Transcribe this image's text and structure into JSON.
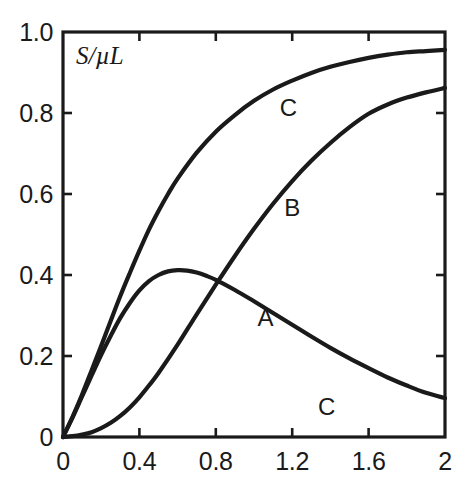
{
  "chart_data": {
    "type": "line",
    "title": "",
    "subtitle": "",
    "xlabel": "",
    "ylabel": "S/µL",
    "ylabel_display": "S/µL",
    "xlim": [
      0,
      2
    ],
    "ylim": [
      0,
      1.0
    ],
    "grid": false,
    "legend_position": "inline-annotations",
    "x_ticks": [
      0,
      0.4,
      0.8,
      1.2,
      1.6,
      2
    ],
    "x_tick_labels": [
      "0",
      "0.4",
      "0.8",
      "1.2",
      "1.6",
      "2"
    ],
    "y_ticks": [
      0,
      0.2,
      0.4,
      0.6,
      0.8,
      1.0
    ],
    "y_tick_labels": [
      "0",
      "0.2",
      "0.4",
      "0.6",
      "0.8",
      "1.0"
    ],
    "line_color": "#1a1a1a",
    "frame_color": "#1a1a1a",
    "series": [
      {
        "name": "A",
        "label": "A",
        "label_x": 1.06,
        "label_y": 0.295,
        "x": [
          0,
          0.05,
          0.1,
          0.15,
          0.2,
          0.25,
          0.3,
          0.35,
          0.4,
          0.45,
          0.5,
          0.55,
          0.6,
          0.65,
          0.7,
          0.75,
          0.8,
          0.9,
          1.0,
          1.1,
          1.2,
          1.3,
          1.4,
          1.5,
          1.6,
          1.7,
          1.8,
          1.9,
          2.0
        ],
        "y": [
          0,
          0.048,
          0.1,
          0.152,
          0.203,
          0.25,
          0.294,
          0.331,
          0.362,
          0.385,
          0.4,
          0.409,
          0.412,
          0.411,
          0.406,
          0.398,
          0.388,
          0.363,
          0.335,
          0.306,
          0.277,
          0.248,
          0.22,
          0.194,
          0.17,
          0.147,
          0.127,
          0.109,
          0.096
        ]
      },
      {
        "name": "B",
        "label": "B",
        "label_x": 1.2,
        "label_y": 0.565,
        "x": [
          0,
          0.05,
          0.1,
          0.15,
          0.2,
          0.25,
          0.3,
          0.35,
          0.4,
          0.45,
          0.5,
          0.6,
          0.7,
          0.8,
          0.9,
          1.0,
          1.1,
          1.2,
          1.3,
          1.4,
          1.5,
          1.6,
          1.7,
          1.8,
          1.9,
          2.0
        ],
        "y": [
          0,
          0.002,
          0.006,
          0.012,
          0.022,
          0.035,
          0.052,
          0.073,
          0.098,
          0.127,
          0.158,
          0.228,
          0.303,
          0.376,
          0.447,
          0.514,
          0.576,
          0.632,
          0.682,
          0.726,
          0.765,
          0.798,
          0.821,
          0.838,
          0.851,
          0.862
        ]
      },
      {
        "name": "C",
        "label": "C",
        "label_x": 1.18,
        "label_y": 0.812,
        "x": [
          0,
          0.05,
          0.1,
          0.15,
          0.2,
          0.25,
          0.3,
          0.35,
          0.4,
          0.45,
          0.5,
          0.55,
          0.6,
          0.7,
          0.8,
          0.9,
          1.0,
          1.1,
          1.2,
          1.3,
          1.4,
          1.5,
          1.6,
          1.7,
          1.8,
          1.9,
          2.0
        ],
        "y": [
          0,
          0.05,
          0.105,
          0.165,
          0.225,
          0.287,
          0.348,
          0.405,
          0.46,
          0.512,
          0.558,
          0.6,
          0.638,
          0.702,
          0.754,
          0.795,
          0.83,
          0.858,
          0.88,
          0.899,
          0.914,
          0.926,
          0.936,
          0.944,
          0.95,
          0.953,
          0.956
        ]
      }
    ],
    "annotations": [
      {
        "text": "C",
        "x": 1.38,
        "y": 0.075,
        "name": "curve-label-c-lower"
      }
    ]
  },
  "geometry": {
    "plot_left": 63,
    "plot_top": 32,
    "plot_right": 445,
    "plot_bottom": 437,
    "tick_len": 9,
    "frame_width": 3.2,
    "curve_width": 4.2
  }
}
